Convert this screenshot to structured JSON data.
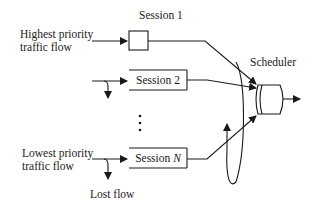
{
  "diagram": {
    "labels": {
      "highest_line1": "Highest priority",
      "highest_line2": "traffic flow",
      "lowest_line1": "Lowest priority",
      "lowest_line2": "traffic flow",
      "lost_flow": "Lost flow",
      "scheduler": "Scheduler",
      "session1": "Session 1",
      "session2": "Session 2",
      "sessionN_prefix": "Session ",
      "sessionN_var": "N",
      "ellipsis": "⋮"
    },
    "colors": {
      "stroke": "#1a1a1a",
      "background": "#ffffff"
    }
  }
}
